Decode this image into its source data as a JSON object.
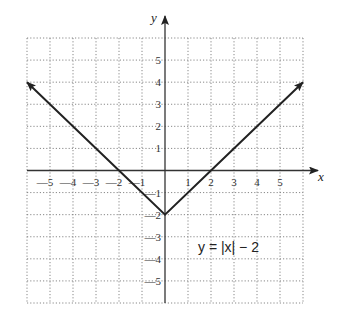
{
  "chart_data": {
    "type": "line",
    "title": "",
    "equation_label": "y = |x| − 2",
    "xlabel": "x",
    "ylabel": "y",
    "xlim": [
      -6,
      6
    ],
    "ylim": [
      -6,
      6
    ],
    "grid": true,
    "grid_style": "dotted",
    "x_ticks": [
      -5,
      -4,
      -3,
      -2,
      -1,
      1,
      2,
      3,
      4,
      5
    ],
    "x_tick_labels": [
      "—5",
      "—4",
      "—3",
      "—2",
      "—1",
      "1",
      "2",
      "3",
      "4",
      "5"
    ],
    "y_ticks": [
      5,
      4,
      3,
      2,
      1,
      -1,
      -2,
      -3,
      -4,
      -5
    ],
    "y_tick_labels": [
      "5",
      "4",
      "3",
      "2",
      "1",
      "—1",
      "—2",
      "—3",
      "—4",
      "—5"
    ],
    "series": [
      {
        "name": "y = |x| − 2",
        "x": [
          -6,
          -2,
          0,
          2,
          6
        ],
        "y": [
          4,
          0,
          -2,
          0,
          4
        ],
        "arrows": "both-ends",
        "color": "#222222"
      }
    ]
  }
}
